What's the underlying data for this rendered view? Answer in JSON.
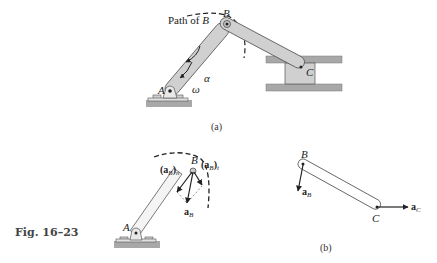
{
  "figure": {
    "caption": "Fig. 16–23"
  },
  "panel_a": {
    "label": "(a)",
    "path_label": "Path of ",
    "path_point": "B",
    "points": {
      "A": "A",
      "B": "B",
      "C": "C"
    },
    "omega": "ω",
    "alpha": "α"
  },
  "panel_a2": {
    "points": {
      "A": "A",
      "B": "B"
    },
    "vectors": {
      "aB_n_main": "(a",
      "aB_n_sub": "B",
      "aB_n_close": ")",
      "aB_n_subscript": "n",
      "aB_t_main": "(a",
      "aB_t_sub": "B",
      "aB_t_close": ")",
      "aB_t_subscript": "t",
      "aB_main": "a",
      "aB_sub": "B"
    }
  },
  "panel_b": {
    "label": "(b)",
    "points": {
      "B": "B",
      "C": "C"
    },
    "vectors": {
      "aB_main": "a",
      "aB_sub": "B",
      "aC_main": "a",
      "aC_sub": "C"
    }
  },
  "colors": {
    "link_fill": "#d0d0d0",
    "link_stroke": "#555555",
    "ground": "#a8a8a8",
    "ink": "#222222"
  }
}
